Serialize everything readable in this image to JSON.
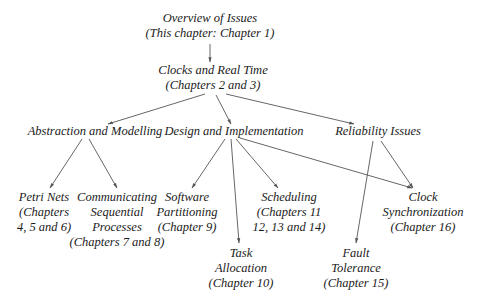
{
  "diagram": {
    "type": "hierarchy",
    "nodes": {
      "overview": {
        "lines": [
          "Overview of Issues",
          "(This chapter: Chapter 1)"
        ]
      },
      "clocks": {
        "lines": [
          "Clocks and Real Time",
          "(Chapters 2 and 3)"
        ]
      },
      "abstraction": {
        "lines": [
          "Abstraction and Modelling"
        ]
      },
      "design": {
        "lines": [
          "Design and Implementation"
        ]
      },
      "reliability": {
        "lines": [
          "Reliability Issues"
        ]
      },
      "petri": {
        "lines": [
          "Petri Nets",
          "(Chapters",
          "4, 5 and 6)"
        ]
      },
      "csp": {
        "lines": [
          "Communicating",
          "Sequential",
          "Processes",
          "(Chapters 7 and 8)"
        ]
      },
      "software": {
        "lines": [
          "Software",
          "Partitioning",
          "(Chapter 9)"
        ]
      },
      "scheduling": {
        "lines": [
          "Scheduling",
          "(Chapters 11",
          "12, 13 and 14)"
        ]
      },
      "clocksync": {
        "lines": [
          "Clock",
          "Synchronization",
          "(Chapter 16)"
        ]
      },
      "task": {
        "lines": [
          "Task",
          "Allocation",
          "(Chapter 10)"
        ]
      },
      "fault": {
        "lines": [
          "Fault",
          "Tolerance",
          "(Chapter 15)"
        ]
      }
    },
    "edges": [
      [
        "overview",
        "clocks"
      ],
      [
        "clocks",
        "abstraction"
      ],
      [
        "clocks",
        "design"
      ],
      [
        "clocks",
        "reliability"
      ],
      [
        "abstraction",
        "petri"
      ],
      [
        "abstraction",
        "csp"
      ],
      [
        "design",
        "software"
      ],
      [
        "design",
        "task"
      ],
      [
        "design",
        "scheduling"
      ],
      [
        "design",
        "clocksync"
      ],
      [
        "reliability",
        "fault"
      ],
      [
        "reliability",
        "clocksync"
      ]
    ],
    "colors": {
      "line": "#555555",
      "text": "#1a1a1a",
      "background": "#ffffff"
    }
  }
}
